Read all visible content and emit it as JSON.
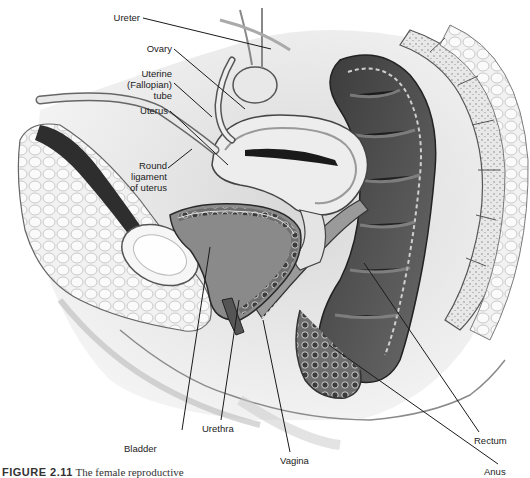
{
  "figure": {
    "caption_number": "FIGURE 2.11",
    "caption_text": "The female reproductive",
    "labels": [
      {
        "id": "ureter",
        "text": "Ureter"
      },
      {
        "id": "ovary",
        "text": "Ovary"
      },
      {
        "id": "uterine-tube",
        "lines": [
          "Uterine",
          "(Fallopian)",
          "tube"
        ]
      },
      {
        "id": "uterus",
        "text": "Uterus"
      },
      {
        "id": "round-ligament",
        "lines": [
          "Round",
          "ligament",
          "of uterus"
        ]
      },
      {
        "id": "bladder",
        "text": "Bladder"
      },
      {
        "id": "urethra",
        "text": "Urethra"
      },
      {
        "id": "vagina",
        "text": "Vagina"
      },
      {
        "id": "rectum",
        "text": "Rectum"
      },
      {
        "id": "anus",
        "text": "Anus"
      }
    ]
  }
}
